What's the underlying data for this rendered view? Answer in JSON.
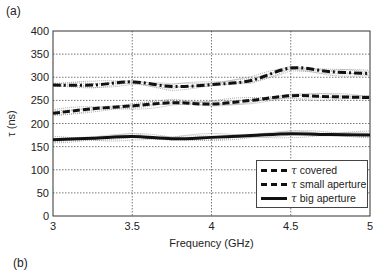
{
  "panel_labels": {
    "a": "(a)",
    "b": "(b)"
  },
  "chart_data": {
    "type": "line",
    "title": "",
    "xlabel": "Frequency (GHz)",
    "ylabel": "τ (ns)",
    "xlim": [
      3,
      5
    ],
    "ylim": [
      0,
      400
    ],
    "xticks": [
      "3",
      "3.5",
      "4",
      "4.5",
      "5"
    ],
    "yticks": [
      "0",
      "50",
      "100",
      "150",
      "200",
      "250",
      "300",
      "350",
      "400"
    ],
    "grid": true,
    "legend_position": "lower right",
    "x": [
      3.0,
      3.25,
      3.5,
      3.75,
      4.0,
      4.25,
      4.5,
      4.75,
      5.0
    ],
    "series": [
      {
        "name": "τ covered",
        "style": "dash-dot",
        "values": [
          283,
          283,
          290,
          280,
          284,
          293,
          320,
          312,
          308
        ]
      },
      {
        "name": "τ small aperture",
        "style": "dashed",
        "values": [
          222,
          232,
          238,
          245,
          242,
          250,
          260,
          258,
          256
        ]
      },
      {
        "name": "τ big aperture",
        "style": "solid",
        "values": [
          165,
          168,
          172,
          167,
          170,
          174,
          178,
          176,
          175
        ]
      }
    ],
    "annotations": "Thin dotted gray lines show individual measurement traces around each mean curve"
  },
  "legend": {
    "items": [
      {
        "symbol": "τ",
        "label": "covered"
      },
      {
        "symbol": "τ",
        "label": "small aperture"
      },
      {
        "symbol": "τ",
        "label": "big aperture"
      }
    ]
  }
}
